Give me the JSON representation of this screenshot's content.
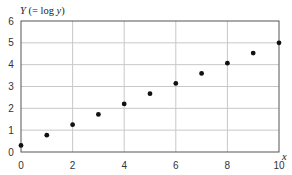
{
  "chart_data": {
    "type": "scatter",
    "title": "",
    "xlabel": "x",
    "ylabel": "Y (= log y)",
    "xlim": [
      0,
      10
    ],
    "ylim": [
      0,
      6
    ],
    "grid": true,
    "legend": null,
    "x_ticks": [
      0,
      2,
      4,
      6,
      8,
      10
    ],
    "y_ticks": [
      0,
      1,
      2,
      3,
      4,
      5,
      6
    ],
    "series": [
      {
        "name": "data",
        "x": [
          0,
          1,
          2,
          3,
          4,
          5,
          6,
          7,
          8,
          9,
          10
        ],
        "y": [
          0.3,
          0.77,
          1.25,
          1.72,
          2.2,
          2.67,
          3.14,
          3.6,
          4.07,
          4.53,
          5.0
        ],
        "marker": "circle",
        "color": "#111111"
      }
    ]
  },
  "colors": {
    "grid": "#c8c8c8",
    "frame": "#555555",
    "point": "#111111"
  }
}
